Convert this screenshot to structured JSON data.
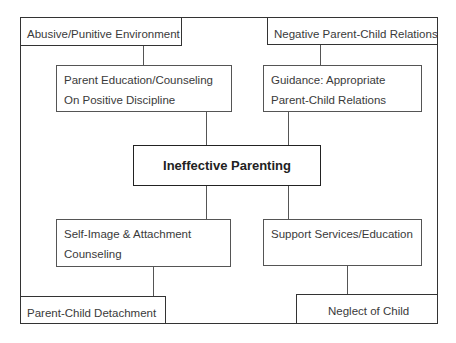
{
  "diagram": {
    "title": "Ineffective Parenting",
    "problems": {
      "top_left": "Abusive/Punitive Environment",
      "top_right": "Negative Parent-Child Relations",
      "bottom_left": "Parent-Child Detachment",
      "bottom_right": "Neglect of Child"
    },
    "interventions": {
      "top_left": [
        "Parent Education/Counseling",
        "On Positive Discipline"
      ],
      "top_right": [
        "Guidance: Appropriate",
        "Parent-Child Relations"
      ],
      "bottom_left": [
        "Self-Image & Attachment",
        "Counseling"
      ],
      "bottom_right": [
        "Support Services/Education"
      ]
    },
    "colors": {
      "line": "#333333",
      "text": "#3a3a3a",
      "background": "#ffffff"
    }
  }
}
